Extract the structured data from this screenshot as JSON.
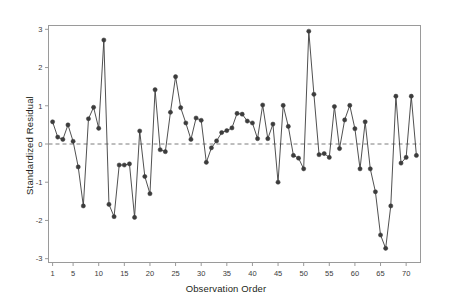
{
  "chart_data": {
    "type": "line",
    "title": "",
    "subtitle": "",
    "xlabel": "Observation Order",
    "ylabel": "Standardized Residual",
    "xlim": [
      0.2,
      72.8
    ],
    "ylim": [
      -3.1,
      3.1
    ],
    "grid": false,
    "legend": null,
    "marker": "filled-circle",
    "reference_line": {
      "y": 0,
      "style": "dashed",
      "color": "#7d7d7d"
    },
    "xticks": [
      1,
      5,
      10,
      15,
      20,
      25,
      30,
      35,
      40,
      45,
      50,
      55,
      60,
      65,
      70
    ],
    "xtick_labels": [
      "1",
      "5",
      "10",
      "15",
      "20",
      "25",
      "30",
      "35",
      "40",
      "45",
      "50",
      "55",
      "60",
      "65",
      "70"
    ],
    "yticks": [
      -3,
      -2,
      -1,
      0,
      1,
      2,
      3
    ],
    "ytick_labels": [
      "-3",
      "-2",
      "-1",
      "0",
      "1",
      "2",
      "3"
    ],
    "series_color": "#3c3c3c",
    "x": [
      1,
      2,
      3,
      4,
      5,
      6,
      7,
      8,
      9,
      10,
      11,
      12,
      13,
      14,
      15,
      16,
      17,
      18,
      19,
      20,
      21,
      22,
      23,
      24,
      25,
      26,
      27,
      28,
      29,
      30,
      31,
      32,
      33,
      34,
      35,
      36,
      37,
      38,
      39,
      40,
      41,
      42,
      43,
      44,
      45,
      46,
      47,
      48,
      49,
      50,
      51,
      52,
      53,
      54,
      55,
      56,
      57,
      58,
      59,
      60,
      61,
      62,
      63,
      64,
      65,
      66,
      67,
      68,
      69,
      70,
      71,
      72
    ],
    "series": [
      {
        "name": "Standardized Residual",
        "values": [
          0.58,
          0.18,
          0.12,
          0.5,
          0.07,
          -0.6,
          -1.62,
          0.66,
          0.96,
          0.41,
          2.72,
          -1.58,
          -1.9,
          -0.55,
          -0.55,
          -0.52,
          -1.92,
          0.34,
          -0.85,
          -1.3,
          1.42,
          -0.15,
          -0.2,
          0.83,
          1.76,
          0.95,
          0.55,
          0.12,
          0.68,
          0.62,
          -0.48,
          -0.1,
          0.08,
          0.3,
          0.35,
          0.42,
          0.8,
          0.78,
          0.6,
          0.55,
          0.14,
          1.02,
          0.14,
          0.52,
          -1.0,
          1.01,
          0.46,
          -0.3,
          -0.37,
          -0.65,
          2.95,
          1.3,
          -0.28,
          -0.25,
          -0.35,
          0.98,
          -0.12,
          0.63,
          1.01,
          0.4,
          -0.65,
          0.58,
          -0.65,
          -1.25,
          -2.38,
          -2.73,
          -1.62,
          1.25,
          -0.5,
          -0.35,
          1.25,
          -0.3
        ]
      }
    ]
  }
}
